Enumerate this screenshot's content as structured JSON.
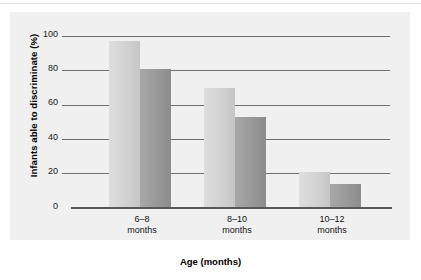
{
  "chart_data": {
    "type": "bar",
    "title": "",
    "xlabel": "Age (months)",
    "ylabel": "Infants able to discriminate (%)",
    "categories": [
      "6–8 months",
      "8–10 months",
      "10–12 months"
    ],
    "category_lines": [
      {
        "range": "6–8",
        "unit": "months"
      },
      {
        "range": "8–10",
        "unit": "months"
      },
      {
        "range": "10–12",
        "unit": "months"
      }
    ],
    "series": [
      {
        "name": "light",
        "values": [
          97,
          70,
          21
        ],
        "color": "#d2d2d2"
      },
      {
        "name": "dark",
        "values": [
          81,
          53,
          14
        ],
        "color": "#999999"
      }
    ],
    "ylim": [
      0,
      100
    ],
    "yticks": [
      0,
      20,
      40,
      60,
      80,
      100
    ],
    "ytick_labels": [
      "0",
      "20",
      "40",
      "60",
      "80",
      "100"
    ],
    "grid": true,
    "legend": "none",
    "panel_color": "#f0f0f0",
    "gridline_color": "#6e6e6e",
    "axis_color": "#585858"
  }
}
